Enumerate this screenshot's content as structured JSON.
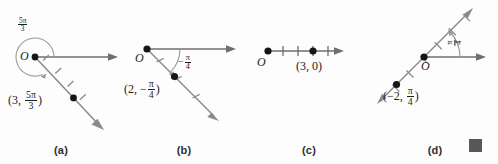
{
  "figure": {
    "background_color": "#fdfdfd",
    "ink_color": "#6e6e6e",
    "point_color": "#161616",
    "text_color": "#1c1c1c",
    "caption_color": "#2e2e2e",
    "end_marker_color": "#585858",
    "width": 498,
    "height": 164
  },
  "panels": [
    {
      "id": "a",
      "caption": "(a)",
      "origin_label": "O",
      "angle_label": {
        "prefix": "",
        "numerator": "5π",
        "denominator": "3"
      },
      "point_label": {
        "open": "(",
        "radius": "3",
        "comma": ", ",
        "numerator": "5π",
        "denominator": "3",
        "close": ")"
      },
      "angle_value_rad": "5π/3",
      "angle_degrees": -60,
      "radius_value": 3,
      "terminal_ray_direction_deg": -60,
      "arc_style": "full-sweep-counterclockwise",
      "tick_count": 4
    },
    {
      "id": "b",
      "caption": "(b)",
      "origin_label": "O",
      "angle_label": {
        "prefix": "−",
        "numerator": "π",
        "denominator": "4"
      },
      "point_label": {
        "open": "(",
        "radius": "2",
        "comma": ", ",
        "sign": "−",
        "numerator": "π",
        "denominator": "4",
        "close": ")"
      },
      "angle_value_rad": "−π/4",
      "angle_degrees": -45,
      "radius_value": 2,
      "terminal_ray_direction_deg": -45,
      "arc_style": "small-clockwise",
      "tick_count": 3
    },
    {
      "id": "c",
      "caption": "(c)",
      "origin_label": "O",
      "angle_label": null,
      "point_label": {
        "text": "(3, 0)"
      },
      "angle_value_rad": "0",
      "angle_degrees": 0,
      "radius_value": 3,
      "terminal_ray_direction_deg": 0,
      "arc_style": "none",
      "tick_count": 4
    },
    {
      "id": "d",
      "caption": "(d)",
      "origin_label": "O",
      "angle_label": {
        "prefix": "",
        "numerator": "π",
        "denominator": "4"
      },
      "point_label": {
        "open": "(",
        "sign": "−",
        "radius": "2",
        "comma": ", ",
        "numerator": "π",
        "denominator": "4",
        "close": ")"
      },
      "angle_value_rad": "π/4",
      "angle_degrees": 45,
      "radius_value": -2,
      "terminal_ray_direction_deg": 45,
      "arc_style": "small-counterclockwise",
      "tick_count": 6
    }
  ],
  "end_marker": {
    "present": true,
    "shape": "square"
  }
}
